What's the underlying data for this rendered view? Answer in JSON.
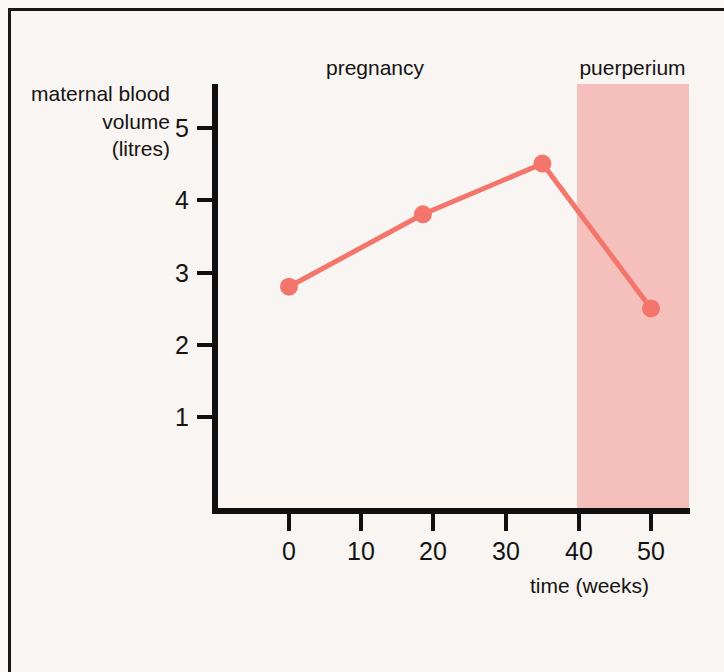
{
  "figure": {
    "background_color": "#F8F5F2",
    "frame_color": "#1a1715"
  },
  "labels": {
    "y_axis_title_line1": "maternal blood",
    "y_axis_title_line2": "volume",
    "y_axis_title_line3": "(litres)",
    "x_axis_title": "time (weeks)",
    "region_pregnancy": "pregnancy",
    "region_puerperium": "puerperium"
  },
  "axes": {
    "y_ticks": [
      "1",
      "2",
      "3",
      "4",
      "5"
    ],
    "x_ticks": [
      "0",
      "10",
      "20",
      "30",
      "40",
      "50"
    ]
  },
  "chart_data": {
    "type": "line",
    "title": "",
    "subtitle": "",
    "xlabel": "time (weeks)",
    "ylabel": "maternal blood volume (litres)",
    "xlim": [
      -4,
      55.5
    ],
    "ylim": [
      0,
      5.55
    ],
    "grid": false,
    "legend": "none",
    "x_ticks": [
      0,
      10,
      20,
      30,
      40,
      50
    ],
    "y_ticks": [
      1,
      2,
      3,
      4,
      5
    ],
    "series": [
      {
        "name": "maternal blood volume",
        "color": "#F4756B",
        "marker": "circle",
        "x": [
          0,
          18.5,
          35,
          50
        ],
        "values": [
          2.8,
          3.8,
          4.5,
          2.5
        ]
      }
    ],
    "annotations": [
      {
        "label": "pregnancy",
        "type": "region-label",
        "x_range": [
          0,
          40
        ],
        "shaded": false
      },
      {
        "label": "puerperium",
        "type": "region-label",
        "x_range": [
          40,
          55.5
        ],
        "shaded": true,
        "shade_color": "#F5C0BC"
      }
    ]
  }
}
